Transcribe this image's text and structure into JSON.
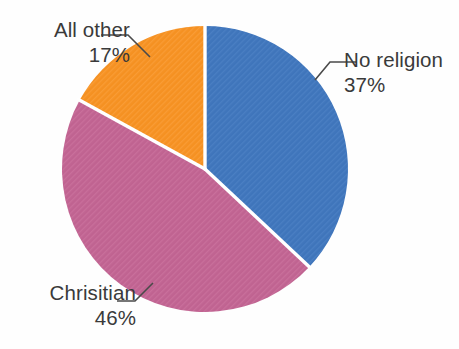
{
  "chart_data": {
    "type": "pie",
    "title": "",
    "subtitle": "",
    "xlabel": "",
    "ylabel": "",
    "legend_position": "none",
    "grid": false,
    "labels_outside": true,
    "start_angle_deg": 0,
    "direction": "clockwise",
    "categories": [
      "No religion",
      "Chrisitian",
      "All other"
    ],
    "values": [
      37,
      46,
      17
    ],
    "value_unit": "%",
    "value_labels": [
      "37%",
      "46%",
      "17%"
    ],
    "colors": [
      "#3f75bb",
      "#c06391",
      "#f59122"
    ],
    "slices": [
      {
        "name": "No religion",
        "value": 37,
        "value_label": "37%",
        "color": "#3f75bb",
        "start_deg": 0,
        "end_deg": 133.2
      },
      {
        "name": "Chrisitian",
        "value": 46,
        "value_label": "46%",
        "color": "#c06391",
        "start_deg": 133.2,
        "end_deg": 298.8
      },
      {
        "name": "All other",
        "value": 17,
        "value_label": "17%",
        "color": "#f59122",
        "start_deg": 298.8,
        "end_deg": 360
      }
    ]
  },
  "figure": {
    "background_color": "#fefefe",
    "separator_color": "#ffffff",
    "text_color": "#3a3a3a",
    "leader_line_color": "#4a4a4a"
  },
  "labels": {
    "all_other": {
      "name": "All other",
      "value": "17%"
    },
    "no_religion": {
      "name": "No religion",
      "value": "37%"
    },
    "chrisitian": {
      "name": "Chrisitian",
      "value": "46%"
    }
  }
}
